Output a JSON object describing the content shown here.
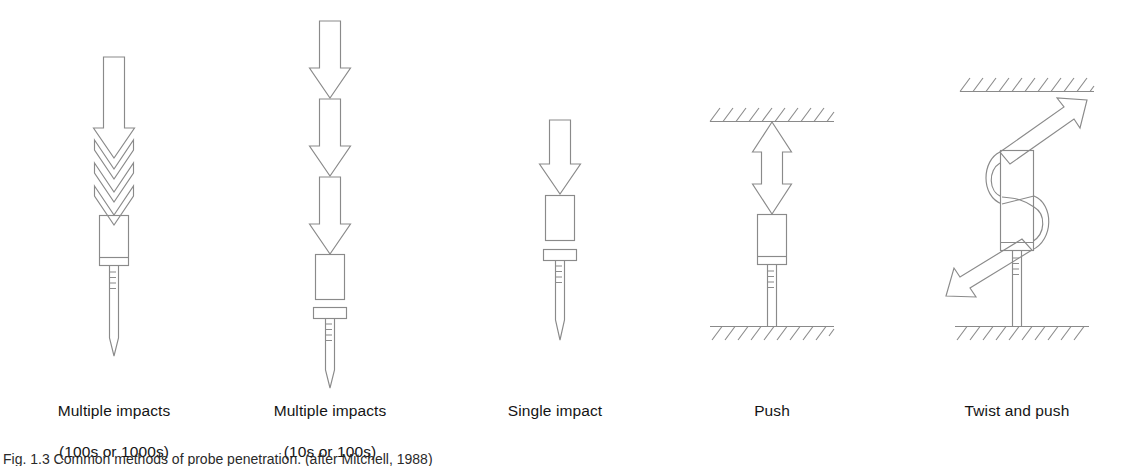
{
  "figure": {
    "background_color": "#ffffff",
    "line_color": "#8a8a8a",
    "text_color": "#141414",
    "caption": "Fig. 1.3  Common methods of probe penetration. (after Mitchell, 1988)"
  },
  "panels": [
    {
      "id": "multiple-impacts-high",
      "label": "Multiple impacts\n(100s or 1000s)",
      "label_line1": "Multiple impacts",
      "label_line2": "(100s or 1000s)",
      "force_type": "impact",
      "arrow_count": 1,
      "chevron_count": 3,
      "has_ceiling": false,
      "has_ground": false,
      "arrow_direction": "down"
    },
    {
      "id": "multiple-impacts-low",
      "label": "Multiple impacts\n(10s or 100s)",
      "label_line1": "Multiple impacts",
      "label_line2": "(10s or 100s)",
      "force_type": "impact",
      "arrow_count": 3,
      "chevron_count": 0,
      "has_ceiling": false,
      "has_ground": false,
      "arrow_direction": "down"
    },
    {
      "id": "single-impact",
      "label": "Single impact",
      "label_line1": "Single impact",
      "label_line2": "",
      "force_type": "impact",
      "arrow_count": 1,
      "chevron_count": 0,
      "has_ceiling": false,
      "has_ground": false,
      "arrow_direction": "down"
    },
    {
      "id": "push",
      "label": "Push",
      "label_line1": "Push",
      "label_line2": "",
      "force_type": "static",
      "arrow_count": 1,
      "chevron_count": 0,
      "has_ceiling": true,
      "has_ground": true,
      "arrow_direction": "double-vertical"
    },
    {
      "id": "twist-and-push",
      "label": "Twist and push",
      "label_line1": "Twist and push",
      "label_line2": "",
      "force_type": "static-torsional",
      "arrow_count": 1,
      "chevron_count": 0,
      "has_ceiling": true,
      "has_ground": true,
      "arrow_direction": "helical-double"
    }
  ]
}
